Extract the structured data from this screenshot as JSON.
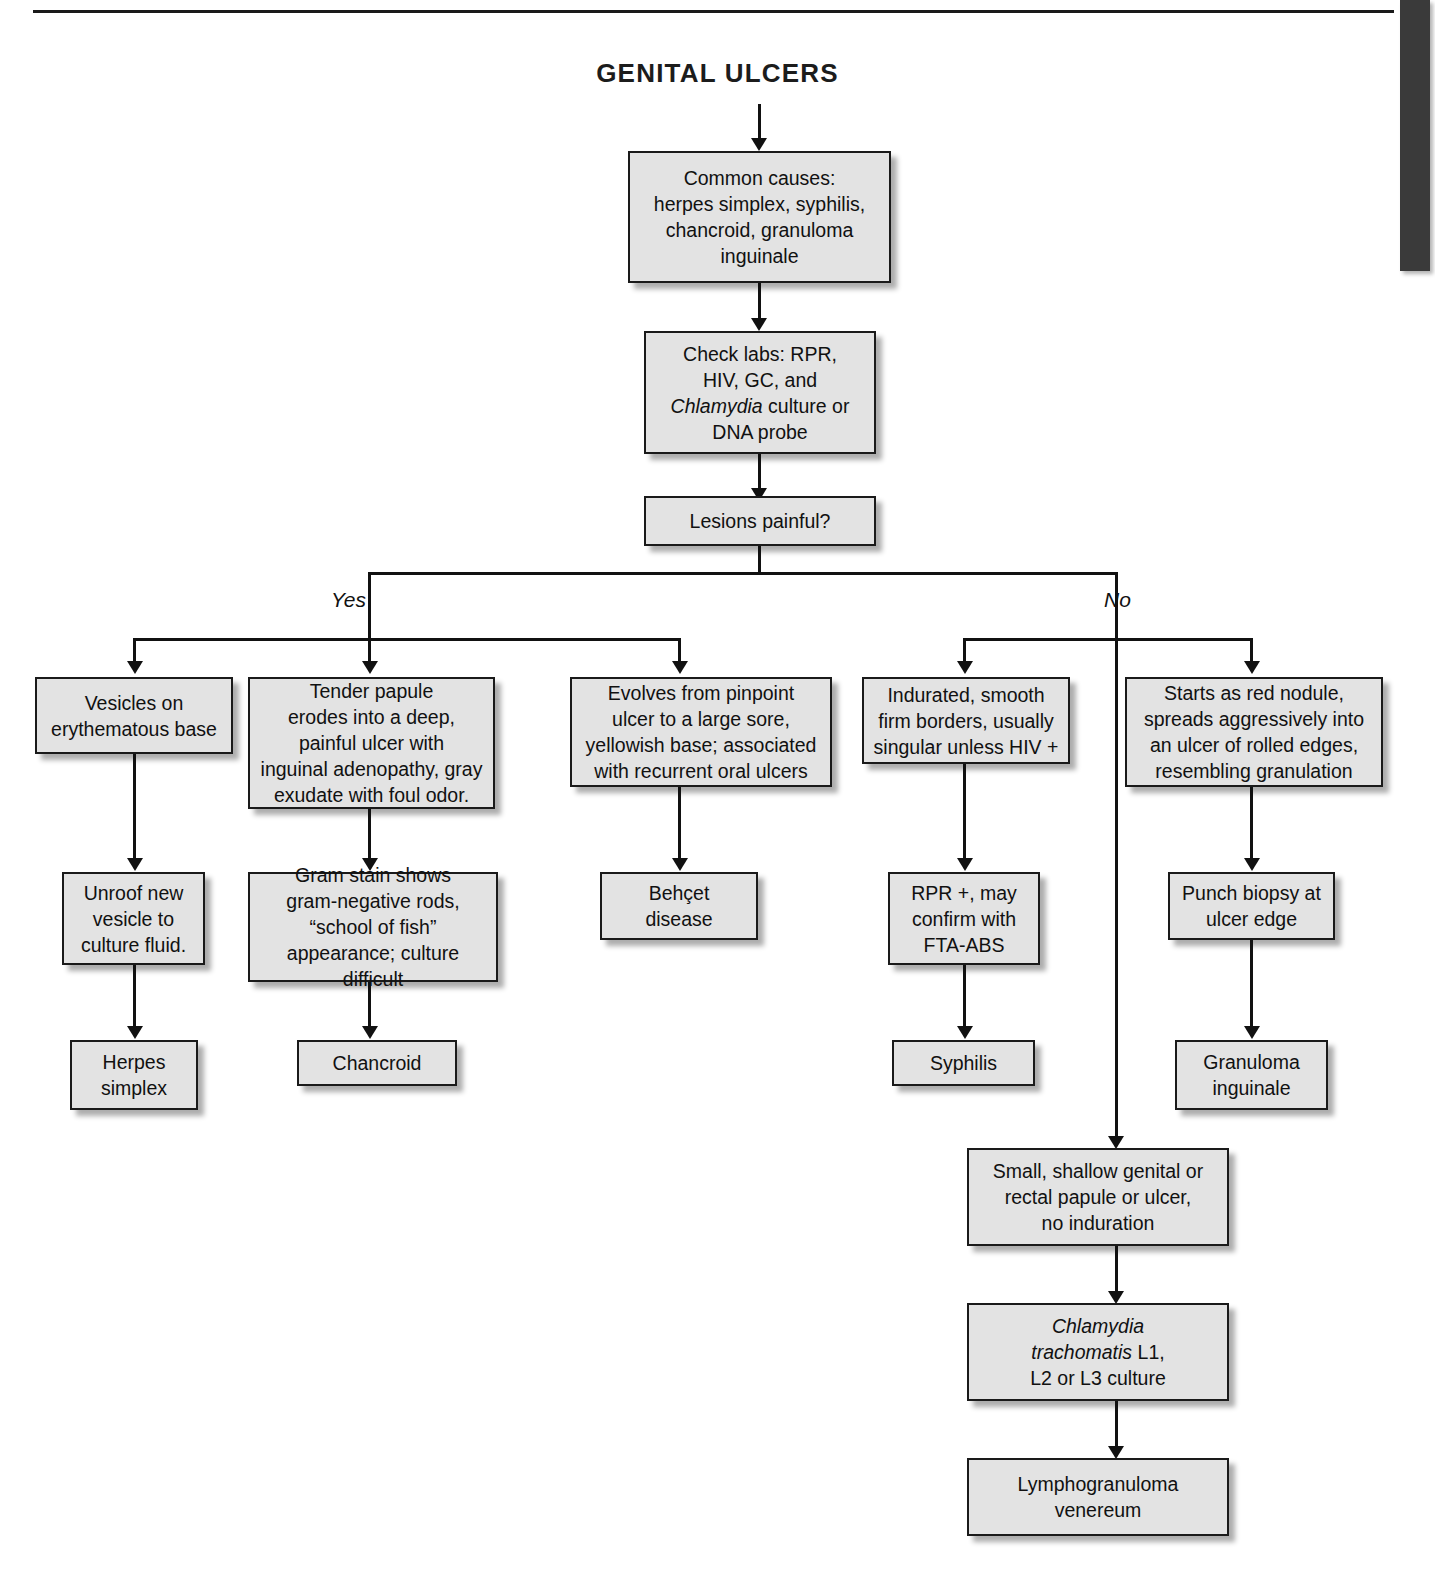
{
  "page": {
    "title": "GENITAL ULCERS"
  },
  "flowchart": {
    "type": "diagram",
    "diagram_kind": "clinical-decision-flowchart",
    "root_label": "GENITAL ULCERS",
    "decision": {
      "question": "Lesions painful?",
      "branch_labels": [
        "Yes",
        "No"
      ]
    },
    "nodes": {
      "common_causes": "Common causes:\nherpes simplex, syphilis,\nchancroid, granuloma\ninguinale",
      "check_labs_line1": "Check labs: RPR,",
      "check_labs_line2": "HIV, GC, and",
      "check_labs_italic": "Chlamydia",
      "check_labs_line3_rest": " culture or",
      "check_labs_line4": "DNA probe",
      "lesions_painful": "Lesions painful?",
      "vesicles": "Vesicles on\nerythematous base",
      "tender_papule": "Tender papule\nerodes into a deep,\npainful ulcer with\ninguinal adenopathy, gray\nexudate with foul odor.",
      "evolves_pinpoint": "Evolves from pinpoint\nulcer to a large sore,\nyellowish base; associated\nwith recurrent oral ulcers",
      "indurated": "Indurated, smooth\nfirm borders, usually\nsingular unless HIV +",
      "red_nodule": "Starts as red nodule,\nspreads aggressively into\nan ulcer of rolled edges,\nresembling granulation",
      "unroof": "Unroof new\nvesicle to\nculture fluid.",
      "gram_stain": "Gram stain shows\ngram-negative rods,\n“school of fish”\nappearance; culture difficult",
      "behcet": "Behçet\ndisease",
      "rpr_plus": "RPR +, may\nconfirm with\nFTA-ABS",
      "punch_biopsy": "Punch biopsy at\nulcer edge",
      "herpes_simplex": "Herpes\nsimplex",
      "chancroid": "Chancroid",
      "syphilis": "Syphilis",
      "granuloma_inguinale": "Granuloma\ninguinale",
      "small_shallow": "Small, shallow genital or\nrectal papule or ulcer,\nno induration",
      "chlamydia_italic": "Chlamydia\ntrachomatis",
      "chlamydia_rest": " L1,\nL2 or L3 culture",
      "lgv": "Lymphogranuloma\nvenereum"
    },
    "edges": [
      {
        "from": "GENITAL ULCERS",
        "to": "Common causes"
      },
      {
        "from": "Common causes",
        "to": "Check labs"
      },
      {
        "from": "Check labs",
        "to": "Lesions painful?"
      },
      {
        "from": "Lesions painful?",
        "to": "Vesicles on erythematous base",
        "label": "Yes"
      },
      {
        "from": "Lesions painful?",
        "to": "Tender papule erodes into a deep, painful ulcer",
        "label": "Yes"
      },
      {
        "from": "Lesions painful?",
        "to": "Evolves from pinpoint ulcer to a large sore",
        "label": "Yes"
      },
      {
        "from": "Lesions painful?",
        "to": "Indurated, smooth firm borders",
        "label": "No"
      },
      {
        "from": "Lesions painful?",
        "to": "Starts as red nodule",
        "label": "No"
      },
      {
        "from": "Lesions painful?",
        "to": "Small, shallow genital or rectal papule or ulcer",
        "label": "No"
      },
      {
        "from": "Vesicles on erythematous base",
        "to": "Unroof new vesicle to culture fluid."
      },
      {
        "from": "Unroof new vesicle to culture fluid.",
        "to": "Herpes simplex"
      },
      {
        "from": "Tender papule erodes into a deep, painful ulcer",
        "to": "Gram stain shows gram-negative rods"
      },
      {
        "from": "Gram stain shows gram-negative rods",
        "to": "Chancroid"
      },
      {
        "from": "Evolves from pinpoint ulcer to a large sore",
        "to": "Behçet disease"
      },
      {
        "from": "Indurated, smooth firm borders",
        "to": "RPR +, may confirm with FTA-ABS"
      },
      {
        "from": "RPR +, may confirm with FTA-ABS",
        "to": "Syphilis"
      },
      {
        "from": "Starts as red nodule",
        "to": "Punch biopsy at ulcer edge"
      },
      {
        "from": "Punch biopsy at ulcer edge",
        "to": "Granuloma inguinale"
      },
      {
        "from": "Small, shallow genital or rectal papule or ulcer",
        "to": "Chlamydia trachomatis L1, L2 or L3 culture"
      },
      {
        "from": "Chlamydia trachomatis L1, L2 or L3 culture",
        "to": "Lymphogranuloma venereum"
      }
    ]
  },
  "colors": {
    "box_fill": "#e3e3e3",
    "box_border": "#1a1a1a",
    "line": "#111111",
    "page_background": "#ffffff",
    "thumb_tab": "#3a3a3a"
  }
}
